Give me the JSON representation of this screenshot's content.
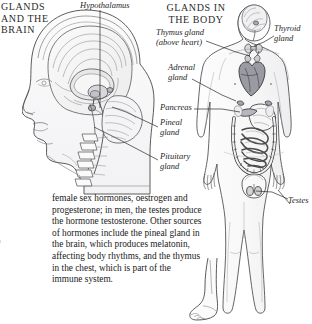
{
  "document": {
    "type": "anatomy-textbook-page",
    "ink_color": "#1a1a1a",
    "line_color": "#3a3a3a"
  },
  "headings": {
    "brain_panel": "GLANDS AND THE BRAIN",
    "body_panel": "GLANDS IN THE BODY"
  },
  "labels": {
    "hypothalamus": "Hypothalamus",
    "thymus": "Thymus gland",
    "thymus_sub": "(above heart)",
    "adrenal_line1": "Adrenal",
    "adrenal_line2": "gland",
    "pancreas": "Pancreas",
    "pineal_line1": "Pineal",
    "pineal_line2": "gland",
    "pituitary_line1": "Pituitary",
    "pituitary_line2": "gland",
    "thyroid_line1": "Thyroid",
    "thyroid_line2": "gland",
    "testes": "Testes"
  },
  "body_text": {
    "paragraph": "female sex hormones, oestrogen and progesterone; in men, the testes produce the hormone testosterone. Other sources of hormones include the pineal gland in the brain, which produces melatonin, affecting body rhythms, and the thymus in the chest, which is part of the immune system."
  },
  "gutter_fragments": {
    "items": [
      "s",
      "f",
      "r",
      "t",
      "p",
      "r",
      "c",
      "i"
    ]
  },
  "illustrations": {
    "head_sagittal": "human-head-sagittal-brain-section",
    "body_anterior": "human-body-anterior-endocrine-organs",
    "foot": "human-foot-illustration"
  }
}
